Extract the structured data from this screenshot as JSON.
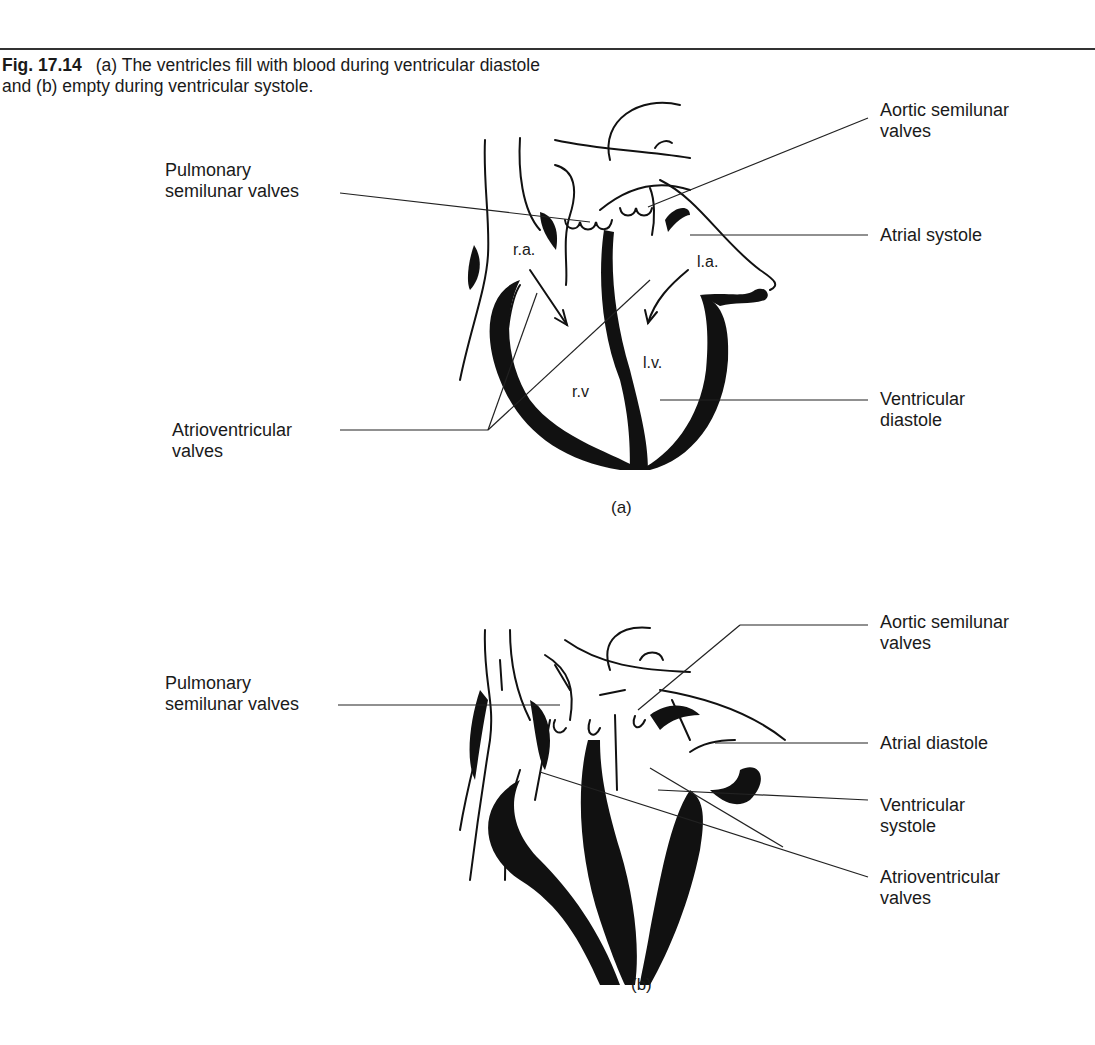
{
  "caption": {
    "figure_number": "Fig. 17.14",
    "text": "(a) The ventricles fill with blood during ventricular diastole and (b) empty during ventricular systole."
  },
  "panel_a": {
    "sublabel": "(a)",
    "chamber_labels": {
      "ra": "r.a.",
      "la": "l.a.",
      "rv": "r.v",
      "lv": "l.v."
    },
    "labels": {
      "pulmonary_line1": "Pulmonary",
      "pulmonary_line2": "semilunar valves",
      "aortic_line1": "Aortic semilunar",
      "aortic_line2": "valves",
      "atrial": "Atrial systole",
      "ventricular_line1": "Ventricular",
      "ventricular_line2": "diastole",
      "av_line1": "Atrioventricular",
      "av_line2": "valves"
    }
  },
  "panel_b": {
    "sublabel": "(b)",
    "labels": {
      "pulmonary_line1": "Pulmonary",
      "pulmonary_line2": "semilunar valves",
      "aortic_line1": "Aortic semilunar",
      "aortic_line2": "valves",
      "atrial": "Atrial diastole",
      "ventricular_line1": "Ventricular",
      "ventricular_line2": "systole",
      "av_line1": "Atrioventricular",
      "av_line2": "valves"
    }
  }
}
